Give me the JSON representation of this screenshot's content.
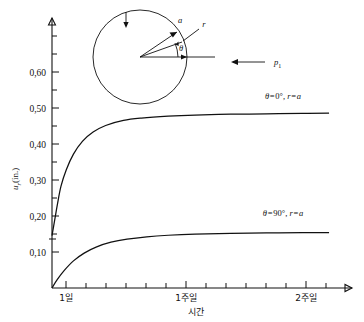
{
  "chart_data": {
    "type": "line",
    "title": "",
    "xlabel": "시간",
    "ylabel": "u_r(in.)",
    "x_tick_labels": [
      "1일",
      "1주일",
      "2주일"
    ],
    "x_tick_values": [
      1,
      7,
      14
    ],
    "y_tick_labels": [
      "0,10",
      "0,20",
      "0,30",
      "0,40",
      "0,50",
      "0,60"
    ],
    "y_tick_values": [
      0.1,
      0.2,
      0.3,
      0.4,
      0.5,
      0.6
    ],
    "ylim": [
      0,
      0.66
    ],
    "xlim": [
      0,
      16
    ],
    "grid": false,
    "legend_position": "inline-right",
    "series": [
      {
        "name": "θ=0°, r=a",
        "label": "θ=0°,  r=a",
        "x": [
          0,
          0.15,
          0.3,
          0.5,
          0.8,
          1.2,
          1.7,
          2.3,
          3.0,
          4.0,
          5.0,
          6.5,
          8.0,
          10.0,
          12.0,
          14.0,
          15.5
        ],
        "y": [
          0.135,
          0.175,
          0.215,
          0.262,
          0.305,
          0.345,
          0.378,
          0.402,
          0.419,
          0.432,
          0.438,
          0.443,
          0.446,
          0.448,
          0.449,
          0.45,
          0.451
        ]
      },
      {
        "name": "θ=90°, r=a",
        "label": "θ=90°,  r=a",
        "x": [
          0,
          0.3,
          0.7,
          1.2,
          1.8,
          2.5,
          3.3,
          4.2,
          5.3,
          6.5,
          8.0,
          10.0,
          12.0,
          14.0,
          15.5
        ],
        "y": [
          0.0,
          0.022,
          0.046,
          0.07,
          0.09,
          0.106,
          0.118,
          0.126,
          0.132,
          0.136,
          0.139,
          0.141,
          0.142,
          0.1425,
          0.143
        ]
      }
    ]
  },
  "inset": {
    "name": "circle-pressure-diagram",
    "radius_label_a": "a",
    "radius_label_r": "r",
    "angle_label": "θ",
    "pressure_label": "p",
    "pressure_subscript": "1"
  },
  "axes": {
    "y_axis_title": "u",
    "y_axis_title_sub": "r",
    "y_axis_title_unit": "(in.)",
    "x_axis_title": "시간"
  }
}
